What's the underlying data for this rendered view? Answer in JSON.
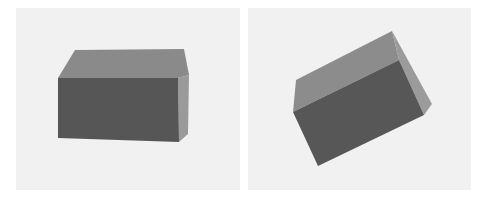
{
  "figure": {
    "panels": [
      {
        "label": "box-view-front",
        "faces": {
          "top": {
            "color": "#8a8a8a",
            "points": "75,50 184,49 189,75 178,78 58,78"
          },
          "side": {
            "color": "#9a9a9a",
            "points": "178,78 189,75 188,134 179,142"
          },
          "front": {
            "color": "#565656",
            "points": "58,78 178,78 179,142 58,138"
          }
        }
      },
      {
        "label": "box-view-rotated",
        "faces": {
          "top": {
            "color": "#8c8c8c",
            "points": "296,80 392,31 399,60 293,112"
          },
          "side": {
            "color": "#9b9b9b",
            "points": "392,31 432,104 424,115 399,60"
          },
          "front": {
            "color": "#575757",
            "points": "293,112 399,60 424,115 318,166"
          }
        }
      }
    ],
    "background_color": "#f1f1f1"
  }
}
